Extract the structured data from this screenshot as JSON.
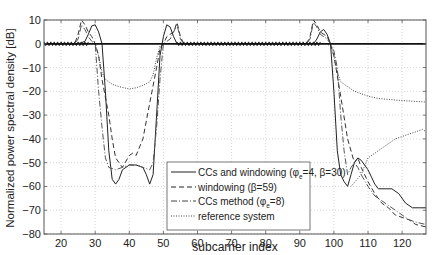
{
  "chart_data": {
    "type": "line",
    "title": "",
    "xlabel": "subcarrier index",
    "ylabel": "Normalized power spectral density [dB]",
    "xlim": [
      15,
      127
    ],
    "ylim": [
      -80,
      10
    ],
    "xticks": [
      20,
      30,
      40,
      50,
      60,
      70,
      80,
      90,
      100,
      110,
      120
    ],
    "yticks": [
      10,
      0,
      -10,
      -20,
      -30,
      -40,
      -50,
      -60,
      -70,
      -80
    ],
    "grid": true,
    "legend_position": "lower center",
    "series": [
      {
        "name": "CCs and windowing (φe=4, β=30)",
        "style": "solid",
        "points": [
          [
            15,
            0
          ],
          [
            20,
            0
          ],
          [
            25,
            0
          ],
          [
            27,
            1
          ],
          [
            28,
            4
          ],
          [
            29,
            7.5
          ],
          [
            30,
            8
          ],
          [
            31,
            5
          ],
          [
            32,
            0
          ],
          [
            33,
            -20
          ],
          [
            34,
            -45
          ],
          [
            35,
            -57
          ],
          [
            36,
            -59
          ],
          [
            37,
            -57
          ],
          [
            38,
            -53
          ],
          [
            40,
            -51
          ],
          [
            42,
            -51
          ],
          [
            44,
            -52
          ],
          [
            45,
            -55
          ],
          [
            46,
            -59
          ],
          [
            47,
            -55
          ],
          [
            48,
            -30
          ],
          [
            49,
            -5
          ],
          [
            50,
            3
          ],
          [
            51,
            8
          ],
          [
            52,
            7
          ],
          [
            53,
            3
          ],
          [
            54,
            0
          ],
          [
            60,
            0
          ],
          [
            70,
            0
          ],
          [
            80,
            0
          ],
          [
            90,
            0
          ],
          [
            94,
            0
          ],
          [
            95,
            2
          ],
          [
            96,
            5
          ],
          [
            97,
            6
          ],
          [
            98,
            4
          ],
          [
            99,
            0
          ],
          [
            100,
            -20
          ],
          [
            101,
            -45
          ],
          [
            102,
            -55
          ],
          [
            103,
            -58
          ],
          [
            104,
            -60
          ],
          [
            105,
            -55
          ],
          [
            106,
            -50
          ],
          [
            107,
            -48
          ],
          [
            108,
            -49
          ],
          [
            109,
            -51
          ],
          [
            110,
            -53
          ],
          [
            111,
            -56
          ],
          [
            112,
            -59
          ],
          [
            113,
            -61
          ],
          [
            115,
            -61
          ],
          [
            117,
            -61
          ],
          [
            119,
            -63
          ],
          [
            121,
            -67
          ],
          [
            123,
            -69
          ],
          [
            125,
            -69
          ],
          [
            127,
            -69
          ]
        ]
      },
      {
        "name": "windowing (β=59)",
        "style": "dashed",
        "points": [
          [
            15,
            0
          ],
          [
            24,
            0
          ],
          [
            25,
            4
          ],
          [
            26,
            10
          ],
          [
            27,
            8
          ],
          [
            28,
            5
          ],
          [
            29,
            3
          ],
          [
            30,
            0
          ],
          [
            31,
            -5
          ],
          [
            32,
            -15
          ],
          [
            34,
            -30
          ],
          [
            35,
            -40
          ],
          [
            36,
            -48
          ],
          [
            38,
            -52
          ],
          [
            40,
            -47
          ],
          [
            41,
            -46
          ],
          [
            42,
            -47
          ],
          [
            44,
            -40
          ],
          [
            46,
            -25
          ],
          [
            48,
            -10
          ],
          [
            49,
            -2
          ],
          [
            50,
            0
          ],
          [
            51,
            3
          ],
          [
            53,
            5
          ],
          [
            54,
            9
          ],
          [
            55,
            3
          ],
          [
            56,
            0
          ],
          [
            90,
            0
          ],
          [
            92,
            0
          ],
          [
            93,
            3
          ],
          [
            94,
            10
          ],
          [
            95,
            8
          ],
          [
            96,
            5
          ],
          [
            98,
            3
          ],
          [
            99,
            0
          ],
          [
            100,
            -5
          ],
          [
            102,
            -22
          ],
          [
            104,
            -40
          ],
          [
            106,
            -50
          ],
          [
            107,
            -48
          ],
          [
            108,
            -52
          ],
          [
            110,
            -58
          ],
          [
            112,
            -63
          ],
          [
            114,
            -67
          ],
          [
            116,
            -69
          ],
          [
            118,
            -72
          ],
          [
            120,
            -73
          ],
          [
            122,
            -74
          ],
          [
            124,
            -76
          ],
          [
            127,
            -77
          ]
        ]
      },
      {
        "name": "CCs method (φe=8)",
        "style": "dashdot",
        "points": [
          [
            15,
            0
          ],
          [
            24,
            0
          ],
          [
            25,
            2
          ],
          [
            26,
            8
          ],
          [
            27,
            6
          ],
          [
            28,
            3
          ],
          [
            29,
            1
          ],
          [
            30,
            0
          ],
          [
            31,
            -20
          ],
          [
            32,
            -35
          ],
          [
            33,
            -48
          ],
          [
            34,
            -52
          ],
          [
            36,
            -53
          ],
          [
            38,
            -52
          ],
          [
            40,
            -51
          ],
          [
            42,
            -51
          ],
          [
            44,
            -52
          ],
          [
            46,
            -53
          ],
          [
            47,
            -50
          ],
          [
            48,
            -35
          ],
          [
            49,
            -15
          ],
          [
            50,
            0
          ],
          [
            52,
            2
          ],
          [
            54,
            8
          ],
          [
            55,
            2
          ],
          [
            56,
            0
          ],
          [
            92,
            0
          ],
          [
            93,
            2
          ],
          [
            94,
            9
          ],
          [
            95,
            7
          ],
          [
            96,
            4
          ],
          [
            98,
            2
          ],
          [
            99,
            0
          ],
          [
            100,
            -3
          ],
          [
            101,
            -10
          ],
          [
            102,
            -30
          ],
          [
            103,
            -45
          ],
          [
            104,
            -55
          ],
          [
            105,
            -52
          ],
          [
            106,
            -50
          ],
          [
            107,
            -52
          ],
          [
            108,
            -55
          ],
          [
            110,
            -60
          ],
          [
            112,
            -64
          ],
          [
            114,
            -66
          ],
          [
            116,
            -68
          ],
          [
            118,
            -70
          ],
          [
            120,
            -72
          ],
          [
            122,
            -74
          ],
          [
            124,
            -75
          ],
          [
            127,
            -76
          ]
        ]
      },
      {
        "name": "reference system",
        "style": "dotted",
        "points": [
          [
            15,
            0
          ],
          [
            27,
            0
          ],
          [
            28,
            0
          ],
          [
            29,
            0
          ],
          [
            30,
            0
          ],
          [
            31,
            -5
          ],
          [
            32,
            -12
          ],
          [
            33,
            -15
          ],
          [
            35,
            -17
          ],
          [
            37,
            -18
          ],
          [
            40,
            -19
          ],
          [
            42,
            -18.5
          ],
          [
            44,
            -17.5
          ],
          [
            46,
            -16
          ],
          [
            47,
            -13
          ],
          [
            48,
            -6
          ],
          [
            49,
            -1
          ],
          [
            50,
            0
          ],
          [
            96,
            0
          ],
          [
            98,
            0
          ],
          [
            99,
            -1
          ],
          [
            100,
            -5
          ],
          [
            101,
            -12
          ],
          [
            102,
            -16
          ],
          [
            104,
            -18
          ],
          [
            106,
            -20
          ],
          [
            108,
            -21
          ],
          [
            110,
            -22
          ],
          [
            113,
            -23
          ],
          [
            117,
            -23.5
          ],
          [
            121,
            -24
          ],
          [
            127,
            -24.5
          ],
          [
            127,
            -24.5
          ]
        ],
        "extra_points": [
          [
            105,
            -60
          ],
          [
            108,
            -55
          ],
          [
            110,
            -48
          ],
          [
            112,
            -46
          ],
          [
            114,
            -44
          ],
          [
            116,
            -42
          ],
          [
            118,
            -40
          ],
          [
            120,
            -39
          ],
          [
            122,
            -38
          ],
          [
            124,
            -37
          ],
          [
            126,
            -36
          ],
          [
            127,
            -37
          ]
        ]
      }
    ],
    "reference_line": {
      "y": 0,
      "style": "solid-thick"
    }
  },
  "legend": {
    "items": [
      {
        "label": "CCs and windowing (φ",
        "sub": "e",
        "label_rest": "=4, β=30)"
      },
      {
        "label": "windowing (β=59)",
        "sub": "",
        "label_rest": ""
      },
      {
        "label": "CCs method (φ",
        "sub": "e",
        "label_rest": "=8)"
      },
      {
        "label": "reference system",
        "sub": "",
        "label_rest": ""
      }
    ]
  }
}
